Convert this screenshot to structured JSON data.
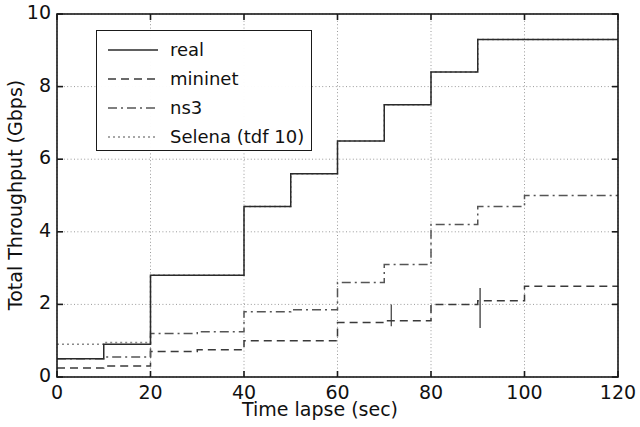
{
  "chart_data": {
    "type": "line",
    "title": "",
    "xlabel": "Time lapse (sec)",
    "ylabel": "Total Throughput (Gbps)",
    "xlim": [
      0,
      120
    ],
    "ylim": [
      0,
      10
    ],
    "xticks": [
      0,
      20,
      40,
      60,
      80,
      100,
      120
    ],
    "yticks": [
      0,
      2,
      4,
      6,
      8,
      10
    ],
    "grid": true,
    "legend_position": "upper left",
    "step_style": "post",
    "series": [
      {
        "name": "real",
        "linestyle": "solid",
        "color": "#2b2b2b",
        "x": [
          0,
          10,
          20,
          30,
          40,
          50,
          60,
          70,
          80,
          90,
          100,
          110,
          120
        ],
        "values": [
          0.5,
          0.9,
          2.8,
          2.8,
          4.7,
          5.6,
          6.5,
          7.5,
          8.4,
          9.3,
          9.3,
          9.3,
          9.3
        ]
      },
      {
        "name": "mininet",
        "linestyle": "dashed",
        "color": "#3a3a3a",
        "x": [
          0,
          10,
          20,
          30,
          40,
          50,
          60,
          70,
          80,
          90,
          100,
          110,
          120
        ],
        "values": [
          0.25,
          0.3,
          0.7,
          0.75,
          1.0,
          1.0,
          1.5,
          1.55,
          2.0,
          2.1,
          2.5,
          2.5,
          2.5
        ]
      },
      {
        "name": "ns3",
        "linestyle": "dashdot",
        "color": "#555555",
        "x": [
          0,
          10,
          20,
          30,
          40,
          50,
          60,
          70,
          80,
          90,
          100,
          110,
          120
        ],
        "values": [
          0.5,
          0.55,
          1.2,
          1.25,
          1.8,
          1.85,
          2.6,
          3.1,
          4.2,
          4.7,
          5.0,
          5.0,
          5.0
        ]
      },
      {
        "name": "Selena (tdf 10)",
        "linestyle": "dotted",
        "color": "#8a8a8a",
        "x": [
          0,
          10,
          20,
          30,
          40,
          50,
          60,
          70,
          80,
          90,
          100,
          110,
          120
        ],
        "values": [
          0.9,
          0.95,
          2.8,
          2.8,
          4.7,
          5.6,
          6.5,
          7.5,
          8.4,
          9.3,
          9.3,
          9.3,
          9.3
        ]
      }
    ],
    "annotations": [
      {
        "note": "mininet shows a brief downward transient spike near t=90"
      },
      {
        "note": "real and Selena (tdf 10) overlap closely across the whole range"
      }
    ]
  },
  "legend": {
    "entries": [
      {
        "label": "real"
      },
      {
        "label": "mininet"
      },
      {
        "label": "ns3"
      },
      {
        "label": "Selena (tdf 10)"
      }
    ]
  },
  "axes": {
    "ylabel": "Total Throughput (Gbps)",
    "xlabel": "Time lapse (sec)",
    "ytick_labels": [
      "0",
      "2",
      "4",
      "6",
      "8",
      "10"
    ],
    "xtick_labels": [
      "0",
      "20",
      "40",
      "60",
      "80",
      "100",
      "120"
    ]
  }
}
